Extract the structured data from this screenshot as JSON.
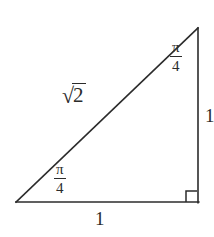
{
  "figure": {
    "background_color": "#ffffff",
    "stroke_color": "#2b2b2b",
    "width": 214,
    "height": 237
  },
  "labels": {
    "hypotenuse": {
      "radical_sign": "√",
      "radicand": "2",
      "full_text": "√2"
    },
    "angle_apex": {
      "numerator": "π",
      "denominator": "4",
      "full_text": "π/4"
    },
    "angle_base": {
      "numerator": "π",
      "denominator": "4",
      "full_text": "π/4"
    },
    "base_side": "1",
    "right_leg": "1"
  },
  "geometry": {
    "vertex_bottom_left": [
      16,
      202
    ],
    "vertex_bottom_right": [
      198,
      202
    ],
    "vertex_top_right": [
      198,
      28
    ],
    "right_angle_marker": {
      "corner": "bottom-right",
      "size": 11
    }
  }
}
